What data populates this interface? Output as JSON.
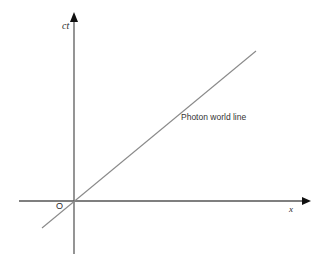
{
  "diagram": {
    "type": "spacetime-diagram",
    "axes": {
      "vertical": {
        "label": "ct",
        "color": "#7a7a7a"
      },
      "horizontal": {
        "label": "x",
        "color": "#5a5a5a"
      }
    },
    "origin_label": "O",
    "world_lines": [
      {
        "label": "Photon world line",
        "color": "#8a8a8a",
        "slope": "45 degrees"
      }
    ]
  }
}
